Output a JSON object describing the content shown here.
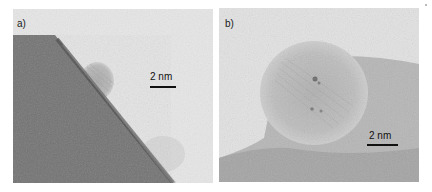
{
  "figure": {
    "panels": [
      {
        "id": "a",
        "label": "a)",
        "scale_bar": {
          "text": "2 nm"
        },
        "content": "TEM micrograph: dark substrate lower-left with diagonal edge, small lattice-fringed nanoparticle attached at edge, light amorphous background"
      },
      {
        "id": "b",
        "label": "b)",
        "scale_bar": {
          "text": "2 nm"
        },
        "content": "TEM micrograph: rounded nanoparticle with lattice fringes on grey support, light background upper-left"
      }
    ],
    "colors": {
      "background_light": "#e6e6e6",
      "substrate_dark": "#6e6e6e",
      "edge_band": "#4a4a4a",
      "particle_grey": "#b9b9b9",
      "scale_bar": "#111111"
    }
  }
}
